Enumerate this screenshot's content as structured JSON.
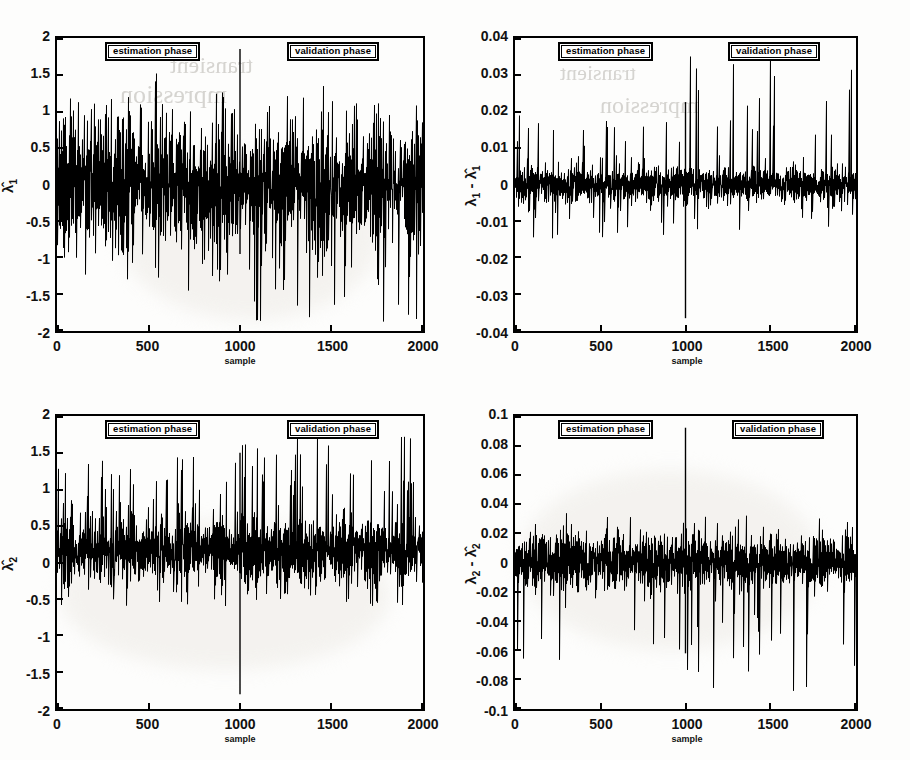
{
  "figure": {
    "panel_count": 4,
    "line_color": "#000000",
    "background_color": "#ffffff",
    "annotation_estimation": "estimation phase",
    "annotation_validation": "validation phase",
    "xlabel": "sample"
  },
  "ghost_text": {
    "line1": "mpression",
    "line2": "transient"
  },
  "chart_data": [
    {
      "id": "panel-top-left",
      "type": "line",
      "title": "",
      "xlabel": "sample",
      "ylabel": "λ̂1",
      "ylabel_plain": "lambda-hat-1",
      "xlim": [
        0,
        2000
      ],
      "ylim": [
        -2,
        2
      ],
      "xticks": [
        0,
        500,
        1000,
        1500,
        2000
      ],
      "xticklabels": [
        "0",
        "500",
        "1000",
        "1500",
        "2000"
      ],
      "yticks": [
        -2,
        -1.5,
        -1,
        -0.5,
        0,
        0.5,
        1,
        1.5,
        2
      ],
      "yticklabels": [
        "-2",
        "-1.5",
        "-1",
        "-0.5",
        "0",
        "0.5",
        "1",
        "1.5",
        "2"
      ],
      "grid": false,
      "legend": null,
      "annotations": [
        {
          "text": "estimation phase",
          "x": 420,
          "y": 1.78
        },
        {
          "text": "validation phase",
          "x": 1470,
          "y": 1.78
        }
      ],
      "phase_boundary_x": 1000,
      "series": [
        {
          "name": "lambda_hat_1",
          "description": "zero-mean noisy oscillating estimate, envelope roughly +/-0.9 with spikes to +1.25 and -1.9",
          "noise_sigma": 0.38,
          "spike_at_boundary": {
            "x": 1000,
            "y_top": 1.85,
            "y_bottom": -0.95
          },
          "envelope_estimation": [
            -1.45,
            1.25
          ],
          "envelope_validation": [
            -1.9,
            1.2
          ],
          "seed": 11
        }
      ]
    },
    {
      "id": "panel-top-right",
      "type": "line",
      "title": "",
      "xlabel": "sample",
      "ylabel": "λ1 - λ̂1",
      "ylabel_plain": "lambda-1 minus lambda-hat-1",
      "xlim": [
        0,
        2000
      ],
      "ylim": [
        -0.04,
        0.04
      ],
      "xticks": [
        0,
        500,
        1000,
        1500,
        2000
      ],
      "xticklabels": [
        "0",
        "500",
        "1000",
        "1500",
        "2000"
      ],
      "yticks": [
        -0.04,
        -0.03,
        -0.02,
        -0.01,
        0,
        0.01,
        0.02,
        0.03,
        0.04
      ],
      "yticklabels": [
        "-0.04",
        "-0.03",
        "-0.02",
        "-0.01",
        "0",
        "0.01",
        "0.02",
        "0.03",
        "0.04"
      ],
      "grid": false,
      "legend": null,
      "annotations": [
        {
          "text": "estimation phase",
          "x": 420,
          "y": 0.0355
        },
        {
          "text": "validation phase",
          "x": 1470,
          "y": 0.0355
        }
      ],
      "phase_boundary_x": 1000,
      "series": [
        {
          "name": "error_1",
          "description": "near-zero residual, band roughly +/-0.004 with occasional spikes to +/-0.02",
          "noise_sigma": 0.0022,
          "spike_at_boundary": {
            "x": 1000,
            "y_top": 0.0225,
            "y_bottom": -0.0365
          },
          "envelope_estimation": [
            -0.015,
            0.019
          ],
          "envelope_validation": [
            -0.013,
            0.038
          ],
          "seed": 22
        }
      ]
    },
    {
      "id": "panel-bottom-left",
      "type": "line",
      "title": "",
      "xlabel": "sample",
      "ylabel": "λ̂2",
      "ylabel_plain": "lambda-hat-2",
      "xlim": [
        0,
        2000
      ],
      "ylim": [
        -2,
        2
      ],
      "xticks": [
        0,
        500,
        1000,
        1500,
        2000
      ],
      "xticklabels": [
        "0",
        "500",
        "1000",
        "1500",
        "2000"
      ],
      "yticks": [
        -2,
        -1.5,
        -1,
        -0.5,
        0,
        0.5,
        1,
        1.5,
        2
      ],
      "yticklabels": [
        "-2",
        "-1.5",
        "-1",
        "-0.5",
        "0",
        "0.5",
        "1",
        "1.5",
        "2"
      ],
      "grid": false,
      "legend": null,
      "annotations": [
        {
          "text": "estimation phase",
          "x": 420,
          "y": 1.78
        },
        {
          "text": "validation phase",
          "x": 1470,
          "y": 1.78
        }
      ],
      "phase_boundary_x": 1000,
      "series": [
        {
          "name": "lambda_hat_2",
          "description": "positive-biased noisy estimate around +0.15, dense band +/-0.3 with upward spikes to 1.8",
          "noise_sigma": 0.2,
          "mean_level": 0.15,
          "spike_at_boundary": {
            "x": 1000,
            "y_top": 1.5,
            "y_bottom": -1.8
          },
          "envelope_estimation": [
            -0.62,
            1.47
          ],
          "envelope_validation": [
            -0.55,
            1.8
          ],
          "seed": 33
        }
      ]
    },
    {
      "id": "panel-bottom-right",
      "type": "line",
      "title": "",
      "xlabel": "sample",
      "ylabel": "λ2 - λ̂2",
      "ylabel_plain": "lambda-2 minus lambda-hat-2",
      "xlim": [
        0,
        2000
      ],
      "ylim": [
        -0.1,
        0.1
      ],
      "xticks": [
        0,
        500,
        1000,
        1500,
        2000
      ],
      "xticklabels": [
        "0",
        "500",
        "1000",
        "1500",
        "2000"
      ],
      "yticks": [
        -0.1,
        -0.08,
        -0.06,
        -0.04,
        -0.02,
        0,
        0.02,
        0.04,
        0.06,
        0.08,
        0.1
      ],
      "yticklabels": [
        "-0.1",
        "-0.08",
        "-0.06",
        "-0.04",
        "-0.02",
        "0",
        "0.02",
        "0.04",
        "0.06",
        "0.08",
        "0.1"
      ],
      "grid": false,
      "legend": null,
      "annotations": [
        {
          "text": "estimation phase",
          "x": 420,
          "y": 0.089
        },
        {
          "text": "validation phase",
          "x": 1470,
          "y": 0.089
        }
      ],
      "phase_boundary_x": 1000,
      "series": [
        {
          "name": "error_2",
          "description": "near-zero residual, dense band +/-0.012 with downward spikes to -0.09",
          "noise_sigma": 0.008,
          "spike_at_boundary": {
            "x": 1000,
            "y_top": 0.092,
            "y_bottom": -0.062
          },
          "envelope_estimation": [
            -0.067,
            0.032
          ],
          "envelope_validation": [
            -0.088,
            0.033
          ],
          "seed": 44
        }
      ]
    }
  ]
}
